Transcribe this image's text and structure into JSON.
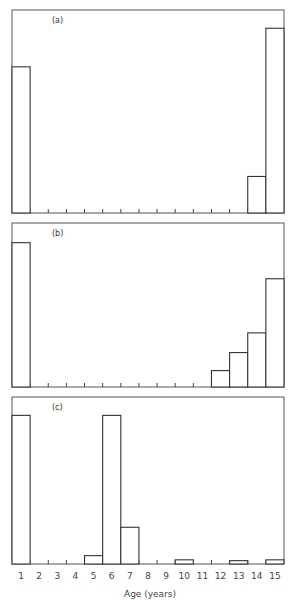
{
  "chart_data": [
    {
      "type": "bar",
      "panel_label": "(a)",
      "categories": [
        "1",
        "2",
        "3",
        "4",
        "5",
        "6",
        "7",
        "8",
        "9",
        "10",
        "11",
        "12",
        "13",
        "14",
        "15"
      ],
      "values": [
        72,
        0,
        0,
        0,
        0,
        0,
        0,
        0,
        0,
        0,
        0,
        0,
        0,
        18,
        91
      ],
      "ylabel": "",
      "ylim": [
        0,
        100
      ],
      "grid": false
    },
    {
      "type": "bar",
      "panel_label": "(b)",
      "categories": [
        "1",
        "2",
        "3",
        "4",
        "5",
        "6",
        "7",
        "8",
        "9",
        "10",
        "11",
        "12",
        "13",
        "14",
        "15"
      ],
      "values": [
        88,
        0,
        0,
        0,
        0,
        0,
        0,
        0,
        0,
        0,
        0,
        10,
        21,
        33,
        66
      ],
      "ylabel": "",
      "ylim": [
        0,
        100
      ],
      "grid": false
    },
    {
      "type": "bar",
      "panel_label": "(c)",
      "categories": [
        "1",
        "2",
        "3",
        "4",
        "5",
        "6",
        "7",
        "8",
        "9",
        "10",
        "11",
        "12",
        "13",
        "14",
        "15"
      ],
      "values": [
        89,
        0,
        0,
        0,
        5,
        89,
        22,
        0,
        0,
        2.5,
        0,
        0,
        2,
        0,
        2.5
      ],
      "ylabel": "",
      "ylim": [
        0,
        100
      ],
      "grid": false
    }
  ],
  "xaxis": {
    "label": "Age (years)",
    "ticks": [
      "1",
      "2",
      "3",
      "4",
      "5",
      "6",
      "7",
      "8",
      "9",
      "10",
      "11",
      "12",
      "13",
      "14",
      "15"
    ]
  },
  "layout": {
    "plot_left": 12,
    "plot_right": 284,
    "panels": [
      {
        "top": 10,
        "baseline": 213
      },
      {
        "top": 223,
        "baseline": 387
      },
      {
        "top": 397,
        "baseline": 564
      }
    ]
  }
}
